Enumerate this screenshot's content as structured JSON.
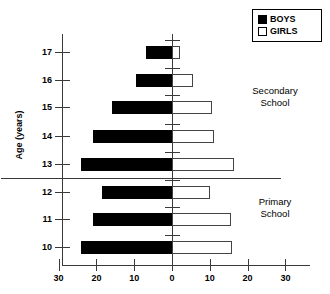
{
  "chart_data": {
    "type": "bar",
    "subtype": "population-pyramid",
    "title": "",
    "xlabel": "",
    "ylabel": "Age (years)",
    "categories": [
      "10",
      "11",
      "12",
      "13",
      "14",
      "15",
      "16",
      "17"
    ],
    "series": [
      {
        "name": "BOYS",
        "direction": "left",
        "values": [
          24,
          21,
          18.5,
          24,
          21,
          16,
          9.5,
          7
        ]
      },
      {
        "name": "GIRLS",
        "direction": "right",
        "values": [
          16,
          15.5,
          10,
          16.5,
          11,
          10.5,
          5.5,
          2
        ]
      }
    ],
    "x_ticks": [
      {
        "label": "30",
        "value": -30
      },
      {
        "label": "20",
        "value": -20
      },
      {
        "label": "10",
        "value": -10
      },
      {
        "label": "0",
        "value": 0
      },
      {
        "label": "10",
        "value": 10
      },
      {
        "label": "20",
        "value": 20
      },
      {
        "label": "30",
        "value": 30
      }
    ],
    "xlim": [
      -30,
      30
    ],
    "grid": false,
    "legend_position": "top-right",
    "legend": [
      "BOYS",
      "GIRLS"
    ],
    "annotations": [
      {
        "name": "secondary-school",
        "line1": "Secondary",
        "line2": "School"
      },
      {
        "name": "primary-school",
        "line1": "Primary",
        "line2": "School"
      }
    ],
    "divider": {
      "between": [
        "12",
        "13"
      ],
      "label": "primary-secondary-divider"
    }
  },
  "axes": {
    "y_title": "Age (years)",
    "y_labels": [
      "17",
      "16",
      "15",
      "14",
      "13",
      "12",
      "11",
      "10"
    ]
  },
  "legend": {
    "boys": {
      "label": "BOYS",
      "color": "#000000"
    },
    "girls": {
      "label": "GIRLS",
      "color": "#ffffff"
    }
  },
  "sections": {
    "secondary": {
      "line1": "Secondary",
      "line2": "School"
    },
    "primary": {
      "line1": "Primary",
      "line2": "School"
    }
  }
}
